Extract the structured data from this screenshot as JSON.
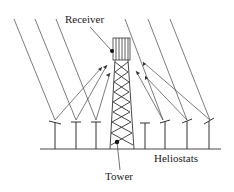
{
  "diagram": {
    "labels": {
      "receiver": "Receiver",
      "tower": "Tower",
      "heliostats": "Heliostats"
    },
    "colors": {
      "line": "#333333",
      "background": "#ffffff"
    },
    "heliostat_count": 8
  }
}
